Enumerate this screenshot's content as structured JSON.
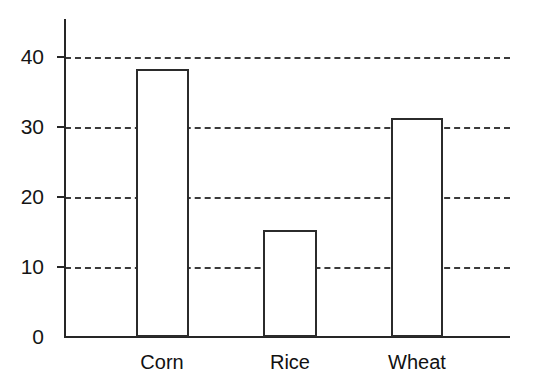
{
  "chart_data": {
    "type": "bar",
    "title": "",
    "subtitle": "",
    "xlabel": "",
    "ylabel": "",
    "categories": [
      "Corn",
      "Rice",
      "Wheat"
    ],
    "values": [
      38.3,
      15.3,
      31.3
    ],
    "series": [
      {
        "name": "",
        "values": [
          38.3,
          15.3,
          31.3
        ]
      }
    ],
    "ylim": [
      0,
      45
    ],
    "yticks": [
      0,
      10,
      20,
      30,
      40
    ],
    "ytick_labels": [
      "0",
      "10",
      "20",
      "30",
      "40"
    ],
    "xtick_labels": [
      "Corn",
      "Rice",
      "Wheat"
    ],
    "grid": "horizontal-dashed",
    "legend": "none",
    "annotations": [],
    "style": {
      "background": "#ffffff",
      "axis_color": "#262626",
      "grid_color": "#3a3a3a",
      "bar_fill": "#ffffff",
      "bar_edge": "#2b2b2b",
      "text_color": "#151515"
    }
  },
  "axis": {
    "y_ticks": [
      {
        "label": "40",
        "value": 40
      },
      {
        "label": "30",
        "value": 30
      },
      {
        "label": "20",
        "value": 20
      },
      {
        "label": "10",
        "value": 10
      },
      {
        "label": "0",
        "value": 0
      }
    ]
  },
  "bars": [
    {
      "label": "Corn",
      "value": 38.3
    },
    {
      "label": "Rice",
      "value": 15.3
    },
    {
      "label": "Wheat",
      "value": 31.3
    }
  ]
}
